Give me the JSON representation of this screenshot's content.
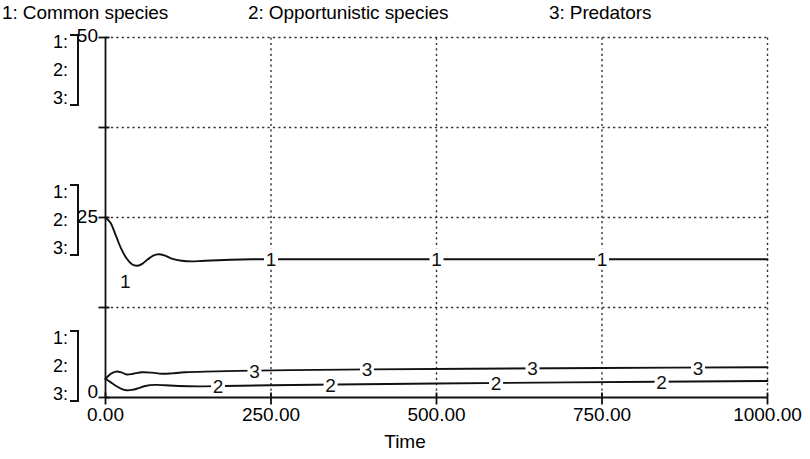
{
  "legend": {
    "entries": [
      {
        "label": "1: Common species"
      },
      {
        "label": "2: Opportunistic species"
      },
      {
        "label": "3: Predators"
      }
    ]
  },
  "scale_groups": [
    {
      "rows": [
        "1:",
        "2:",
        "3:"
      ],
      "value": "50"
    },
    {
      "rows": [
        "1:",
        "2:",
        "3:"
      ],
      "value": "25"
    },
    {
      "rows": [
        "1:",
        "2:",
        "3:"
      ],
      "value": "0"
    }
  ],
  "y_axis": {
    "labels": [
      "50",
      "25",
      "0"
    ],
    "min": 0,
    "max": 50,
    "gridline_values": [
      50,
      37.5,
      25,
      12.5,
      0
    ]
  },
  "x_axis": {
    "title": "Time",
    "tick_labels": [
      "0.00",
      "250.00",
      "500.00",
      "750.00",
      "1000.00"
    ],
    "tick_values": [
      0,
      250,
      500,
      750,
      1000
    ],
    "min": 0,
    "max": 1000
  },
  "chart_data": {
    "type": "line",
    "title": "",
    "subtitle": "",
    "xlabel": "Time",
    "ylabel": "",
    "xlim": [
      0,
      1000
    ],
    "ylim": [
      0,
      50
    ],
    "grid": true,
    "grid_style": "dotted",
    "legend_position": "top",
    "y_tick_labels": [
      "0",
      "25",
      "50"
    ],
    "x_tick_labels": [
      "0.00",
      "250.00",
      "500.00",
      "750.00",
      "1000.00"
    ],
    "series": [
      {
        "name": "1: Common species",
        "marker_label": "1",
        "marker_label_x": [
          250,
          500,
          750
        ],
        "color": "#111111",
        "x": [
          0,
          8,
          16,
          24,
          32,
          40,
          48,
          56,
          64,
          72,
          80,
          90,
          100,
          115,
          130,
          150,
          180,
          220,
          280,
          350,
          450,
          600,
          800,
          1000
        ],
        "y": [
          25.0,
          24.2,
          22.4,
          20.6,
          19.3,
          18.5,
          18.3,
          18.6,
          19.2,
          19.7,
          19.9,
          19.7,
          19.3,
          19.0,
          18.9,
          19.0,
          19.1,
          19.2,
          19.2,
          19.2,
          19.2,
          19.2,
          19.2,
          19.2
        ]
      },
      {
        "name": "2: Opportunistic species",
        "marker_label": "2",
        "marker_label_x": [
          170,
          340,
          590,
          840
        ],
        "color": "#111111",
        "x": [
          0,
          8,
          16,
          24,
          32,
          40,
          50,
          60,
          75,
          90,
          110,
          140,
          180,
          250,
          350,
          500,
          700,
          1000
        ],
        "y": [
          2.6,
          2.1,
          1.6,
          1.2,
          1.0,
          1.05,
          1.3,
          1.6,
          1.75,
          1.7,
          1.6,
          1.55,
          1.6,
          1.7,
          1.8,
          1.95,
          2.1,
          2.3
        ]
      },
      {
        "name": "3: Predators",
        "marker_label": "3",
        "marker_label_x": [
          225,
          395,
          645,
          895
        ],
        "color": "#111111",
        "x": [
          0,
          8,
          16,
          24,
          32,
          42,
          55,
          70,
          85,
          100,
          120,
          150,
          200,
          280,
          400,
          550,
          750,
          1000
        ],
        "y": [
          2.6,
          3.3,
          3.6,
          3.5,
          3.2,
          3.3,
          3.5,
          3.45,
          3.3,
          3.35,
          3.5,
          3.6,
          3.7,
          3.8,
          3.9,
          4.0,
          4.1,
          4.2
        ]
      }
    ]
  },
  "colors": {
    "ink": "#111111",
    "grid": "#333333",
    "background": "#ffffff"
  }
}
